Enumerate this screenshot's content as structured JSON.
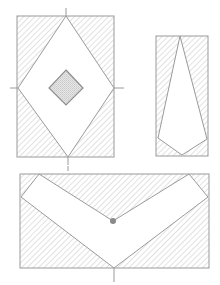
{
  "figure": {
    "style": {
      "background": "#ffffff",
      "outline_color": "#9a9a9a",
      "hatch_color": "#bdbdbd",
      "stipple_fill": "#d6d6d6",
      "dot_color": "#8a8a8a"
    },
    "panels": [
      {
        "id": "panel-1",
        "description": "Rectangle with inscribed diamond touching midpoints of all four sides; small stippled diamond at center; hatched corner triangles; tick marks at each contact point",
        "rect": {
          "x": 17,
          "y": 16,
          "w": 97,
          "h": 141
        },
        "cutout": [
          [
            66,
            16
          ],
          [
            114,
            88
          ],
          [
            68,
            157
          ],
          [
            18,
            88
          ]
        ],
        "inner_diamond": [
          [
            66,
            70
          ],
          [
            83,
            88
          ],
          [
            66,
            105
          ],
          [
            49,
            88
          ]
        ],
        "ticks": [
          [
            [
              66,
              8
            ],
            [
              66,
              16
            ]
          ],
          [
            [
              10,
              88
            ],
            [
              18,
              88
            ]
          ],
          [
            [
              114,
              88
            ],
            [
              124,
              88
            ]
          ],
          [
            [
              68,
              157
            ],
            [
              68,
              165
            ]
          ]
        ]
      },
      {
        "id": "panel-2",
        "description": "Narrow tall rectangle with elongated kite/pentagon cutout; hatched remainder",
        "rect": {
          "x": 156,
          "y": 36,
          "w": 52,
          "h": 120
        },
        "cutout": [
          [
            180,
            36
          ],
          [
            207,
            139
          ],
          [
            182,
            155
          ],
          [
            158,
            138
          ]
        ]
      },
      {
        "id": "panel-3",
        "description": "Wide rectangle with V-shaped (chevron) band cutout; dot at inner vertex; hatched remainder; tick at bottom vertex",
        "rect": {
          "x": 20,
          "y": 174,
          "w": 189,
          "h": 94
        },
        "cutout": [
          [
            39,
            174
          ],
          [
            113,
            221
          ],
          [
            189,
            174
          ],
          [
            208,
            197
          ],
          [
            114,
            268
          ],
          [
            21,
            197
          ]
        ],
        "dot": {
          "cx": 113,
          "cy": 221,
          "r": 3
        },
        "ticks": [
          [
            [
              114,
              268
            ],
            [
              114,
              282
            ]
          ],
          [
            [
              68,
              165
            ],
            [
              68,
              170
            ]
          ]
        ]
      }
    ],
    "caption": ""
  }
}
